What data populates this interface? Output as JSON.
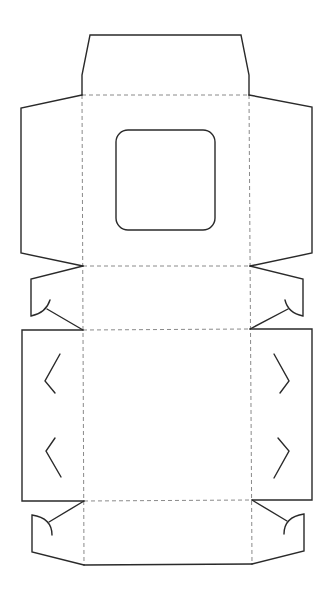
{
  "diagram": {
    "type": "box-dieline",
    "canvas": {
      "width": 331,
      "height": 596,
      "background": "#ffffff"
    },
    "colors": {
      "cut_line": "#2a2a2a",
      "fold_line": "#8a8a8a"
    },
    "panels": [
      {
        "name": "top-tuck-flap",
        "points": "90,35 241,35 249,75 249,95 82,95 82,75"
      },
      {
        "name": "lid-panel-with-window",
        "x": 82,
        "y": 95,
        "width": 167,
        "height": 171
      },
      {
        "name": "front-panel",
        "x": 83,
        "y": 266,
        "width": 167,
        "height": 64
      },
      {
        "name": "base-panel",
        "x": 83,
        "y": 330,
        "width": 169,
        "height": 171
      },
      {
        "name": "back-panel",
        "x": 84,
        "y": 501,
        "width": 168,
        "height": 64
      }
    ],
    "window": {
      "x": 116,
      "y": 130,
      "width": 99,
      "height": 100,
      "radius": 12
    },
    "fold_lines": [
      {
        "x1": 82,
        "y1": 95,
        "x2": 249,
        "y2": 95
      },
      {
        "x1": 83,
        "y1": 266,
        "x2": 250,
        "y2": 266
      },
      {
        "x1": 83,
        "y1": 330,
        "x2": 250,
        "y2": 329
      },
      {
        "x1": 84,
        "y1": 501,
        "x2": 252,
        "y2": 500
      },
      {
        "x1": 82,
        "y1": 95,
        "x2": 84,
        "y2": 565
      },
      {
        "x1": 249,
        "y1": 95,
        "x2": 252,
        "y2": 564
      }
    ],
    "cut_paths": [
      "M82,95 L82,75 L90,35 L241,35 L249,75 L249,95",
      "M82,95 L21,108 L21,253 L83,266",
      "M249,95 L312,107 L312,253 L250,266",
      "M83,266 L31,279 L31,316 Q46,313 50,300",
      "M47,309 L83,330",
      "M250,266 L303,279 L303,316 Q288,313 285,300",
      "M288,309 L250,329",
      "M83,330 L22,330 L22,501 L84,501",
      "M250,329 L312,329 L312,500 L252,500",
      "M84,501 L49,522",
      "M52,535 Q52,518 32,515 L32,552 L84,565",
      "M252,500 L287,521",
      "M284,534 Q284,517 304,514 L304,551 L252,564",
      "M84,565 L252,564"
    ],
    "slots": [
      {
        "name": "left-slot-upper",
        "points": "60,354 45,381 55,393"
      },
      {
        "name": "left-slot-lower",
        "points": "55,438 46,451 61,477"
      },
      {
        "name": "right-slot-upper",
        "points": "274,354 289,381 280,393"
      },
      {
        "name": "right-slot-lower",
        "points": "278,438 289,451 274,478"
      }
    ]
  }
}
